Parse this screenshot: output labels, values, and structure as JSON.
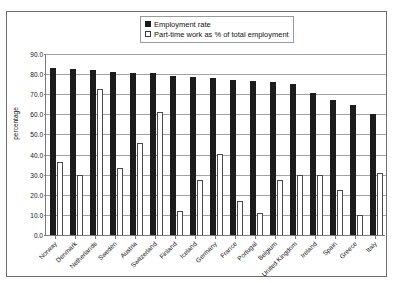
{
  "title_crop": "",
  "legend": {
    "position": "top-center",
    "entries": [
      {
        "label": "Employment rate",
        "swatch": "filled-square",
        "color": "#1c1c1c"
      },
      {
        "label": "Part-time work as % of total employment",
        "swatch": "hollow-square",
        "color": "#ffffff"
      }
    ]
  },
  "axis": {
    "ylabel": "percentage",
    "yticks": [
      "90.0",
      "80.0",
      "70.0",
      "60.0",
      "50.0",
      "40.0",
      "30.0",
      "20.0",
      "10.0",
      "0.0"
    ]
  },
  "chart_data": {
    "type": "bar",
    "title": "",
    "xlabel": "",
    "ylabel": "percentage",
    "ylim": [
      0,
      90
    ],
    "ytick_step": 10,
    "grid": true,
    "legend_position": "top-center",
    "categories": [
      "Norway",
      "Denmark",
      "Netherlands",
      "Sweden",
      "Austria",
      "Switzerland",
      "Finland",
      "Iceland",
      "Germany",
      "France",
      "Portugal",
      "Belgium",
      "United Kingdom",
      "Ireland",
      "Spain",
      "Greece",
      "Italy"
    ],
    "series": [
      {
        "name": "Employment rate",
        "color": "#1c1c1c",
        "values": [
          83.0,
          82.5,
          82.0,
          81.0,
          80.5,
          80.5,
          79.0,
          78.5,
          78.0,
          77.0,
          76.5,
          76.0,
          75.0,
          70.5,
          67.0,
          64.5,
          60.0
        ]
      },
      {
        "name": "Part-time work as % of total employment",
        "color": "#ffffff",
        "values": [
          36.5,
          30.0,
          72.5,
          33.5,
          46.0,
          61.0,
          12.0,
          27.5,
          40.5,
          17.0,
          11.0,
          27.5,
          30.0,
          30.0,
          22.5,
          10.0,
          31.0
        ]
      }
    ]
  }
}
